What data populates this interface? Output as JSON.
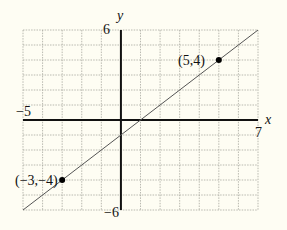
{
  "colors": {
    "background": "#fefdf3",
    "grid": "#a8a8a0",
    "axis": "#111111",
    "line": "#555555",
    "point": "#000000"
  },
  "chart_data": {
    "type": "line",
    "title": "",
    "xlabel": "x",
    "ylabel": "y",
    "xlim": [
      -5,
      7
    ],
    "ylim": [
      -6,
      6
    ],
    "grid": true,
    "grid_step": 1,
    "tick_labels": {
      "x_min": "−5",
      "x_max": "7",
      "y_max": "6",
      "y_min": "−6"
    },
    "series": [
      {
        "name": "line through (-3,-4) and (5,4)",
        "equation": "y = x - 1",
        "x": [
          -5,
          7
        ],
        "y": [
          -6,
          6
        ]
      }
    ],
    "points": [
      {
        "x": -3,
        "y": -4,
        "label": "(−3,−4)"
      },
      {
        "x": 5,
        "y": 4,
        "label": "(5,4)"
      }
    ]
  }
}
